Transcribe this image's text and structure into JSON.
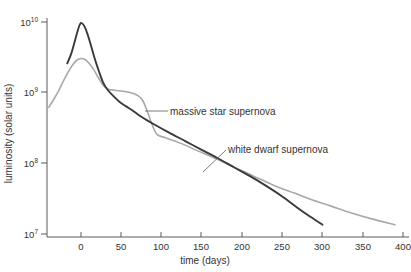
{
  "figure": {
    "caption_fragment": "",
    "background": "#ffffff"
  },
  "axes": {
    "x_title": "time (days)",
    "y_title": "luminosity (solar units)",
    "x_ticks": [
      "0",
      "50",
      "100",
      "150",
      "200",
      "250",
      "300",
      "350",
      "400"
    ],
    "y_ticks": [
      {
        "mantissa": "10",
        "exponent": "10"
      },
      {
        "mantissa": "10",
        "exponent": "9"
      },
      {
        "mantissa": "10",
        "exponent": "8"
      },
      {
        "mantissa": "10",
        "exponent": "7"
      }
    ],
    "axis_color": "#5a5a5a"
  },
  "annotations": {
    "massive": "massive star supernova",
    "white_dwarf": "white dwarf supernova"
  },
  "chart_data": {
    "type": "line",
    "title": "",
    "xlabel": "time (days)",
    "ylabel": "luminosity (solar units)",
    "xlim": [
      -40,
      410
    ],
    "ylim": [
      10000000,
      10000000000
    ],
    "yscale": "log",
    "grid": false,
    "legend": "inline-annotations",
    "xticks": [
      0,
      50,
      100,
      150,
      200,
      250,
      300,
      350,
      400
    ],
    "yticks": [
      10000000,
      100000000,
      1000000000,
      10000000000
    ],
    "series": [
      {
        "name": "white dwarf supernova",
        "color": "#3a3a3a",
        "width": 1.9,
        "points": [
          [
            -17,
            2600000000.0
          ],
          [
            -12,
            3600000000.0
          ],
          [
            -8,
            5200000000.0
          ],
          [
            -4,
            7600000000.0
          ],
          [
            -1,
            9400000000.0
          ],
          [
            1,
            9600000000.0
          ],
          [
            4,
            8800000000.0
          ],
          [
            8,
            6800000000.0
          ],
          [
            13,
            4400000000.0
          ],
          [
            18,
            2800000000.0
          ],
          [
            23,
            1900000000.0
          ],
          [
            28,
            1350000000.0
          ],
          [
            33,
            1100000000.0
          ],
          [
            40,
            900000000.0
          ],
          [
            48,
            740000000.0
          ],
          [
            56,
            640000000.0
          ],
          [
            64,
            560000000.0
          ],
          [
            72,
            480000000.0
          ],
          [
            80,
            420000000.0
          ],
          [
            90,
            360000000.0
          ],
          [
            110,
            270000000.0
          ],
          [
            130,
            205000000.0
          ],
          [
            150,
            155000000.0
          ],
          [
            170,
            118000000.0
          ],
          [
            190,
            88000000.0
          ],
          [
            210,
            66000000.0
          ],
          [
            230,
            48000000.0
          ],
          [
            250,
            34000000.0
          ],
          [
            270,
            23000000.0
          ],
          [
            285,
            17500000.0
          ],
          [
            300,
            13500000.0
          ]
        ]
      },
      {
        "name": "massive star supernova",
        "color": "#a8a8a8",
        "width": 1.6,
        "points": [
          [
            -40,
            620000000.0
          ],
          [
            -34,
            800000000.0
          ],
          [
            -28,
            1050000000.0
          ],
          [
            -22,
            1450000000.0
          ],
          [
            -16,
            1950000000.0
          ],
          [
            -10,
            2500000000.0
          ],
          [
            -5,
            2900000000.0
          ],
          [
            0,
            3050000000.0
          ],
          [
            5,
            2950000000.0
          ],
          [
            10,
            2600000000.0
          ],
          [
            16,
            2100000000.0
          ],
          [
            22,
            1600000000.0
          ],
          [
            28,
            1250000000.0
          ],
          [
            34,
            1120000000.0
          ],
          [
            42,
            1080000000.0
          ],
          [
            52,
            1050000000.0
          ],
          [
            62,
            1000000000.0
          ],
          [
            70,
            920000000.0
          ],
          [
            76,
            800000000.0
          ],
          [
            82,
            560000000.0
          ],
          [
            88,
            360000000.0
          ],
          [
            93,
            270000000.0
          ],
          [
            97,
            245000000.0
          ],
          [
            105,
            230000000.0
          ],
          [
            125,
            190000000.0
          ],
          [
            145,
            150000000.0
          ],
          [
            165,
            120000000.0
          ],
          [
            185,
            94000000.0
          ],
          [
            205,
            74000000.0
          ],
          [
            225,
            58000000.0
          ],
          [
            245,
            46000000.0
          ],
          [
            265,
            38000000.0
          ],
          [
            285,
            31000000.0
          ],
          [
            310,
            25000000.0
          ],
          [
            335,
            20000000.0
          ],
          [
            360,
            16500000.0
          ],
          [
            390,
            13500000.0
          ]
        ]
      }
    ]
  }
}
